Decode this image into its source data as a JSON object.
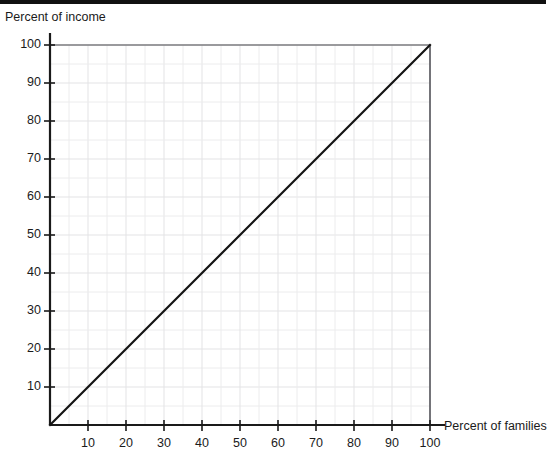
{
  "chart_data": {
    "type": "line",
    "title": "",
    "xlabel": "Percent of families",
    "ylabel": "Percent of income",
    "xlim": [
      0,
      100
    ],
    "ylim": [
      0,
      100
    ],
    "grid": true,
    "legend": "none",
    "xticks": [
      "10",
      "20",
      "30",
      "40",
      "50",
      "60",
      "70",
      "80",
      "90",
      "100"
    ],
    "xtick_values": [
      10,
      20,
      30,
      40,
      50,
      60,
      70,
      80,
      90,
      100
    ],
    "yticks": [
      "10",
      "20",
      "30",
      "40",
      "50",
      "60",
      "70",
      "80",
      "90",
      "100"
    ],
    "ytick_values": [
      10,
      20,
      30,
      40,
      50,
      60,
      70,
      80,
      90,
      100
    ],
    "series": [
      {
        "name": "line of perfect equality",
        "color": "#141414",
        "x": [
          0,
          10,
          20,
          30,
          40,
          50,
          60,
          70,
          80,
          90,
          100
        ],
        "values": [
          0,
          10,
          20,
          30,
          40,
          50,
          60,
          70,
          80,
          90,
          100
        ]
      }
    ],
    "annotations": []
  },
  "colors": {
    "axis": "#1a1a1a",
    "grid_minor": "#ececed",
    "grid_major": "#e3e3e5",
    "border": "#55555a",
    "data_line": "#141414",
    "top_rule": "#111111",
    "text": "#1b1b1b"
  }
}
